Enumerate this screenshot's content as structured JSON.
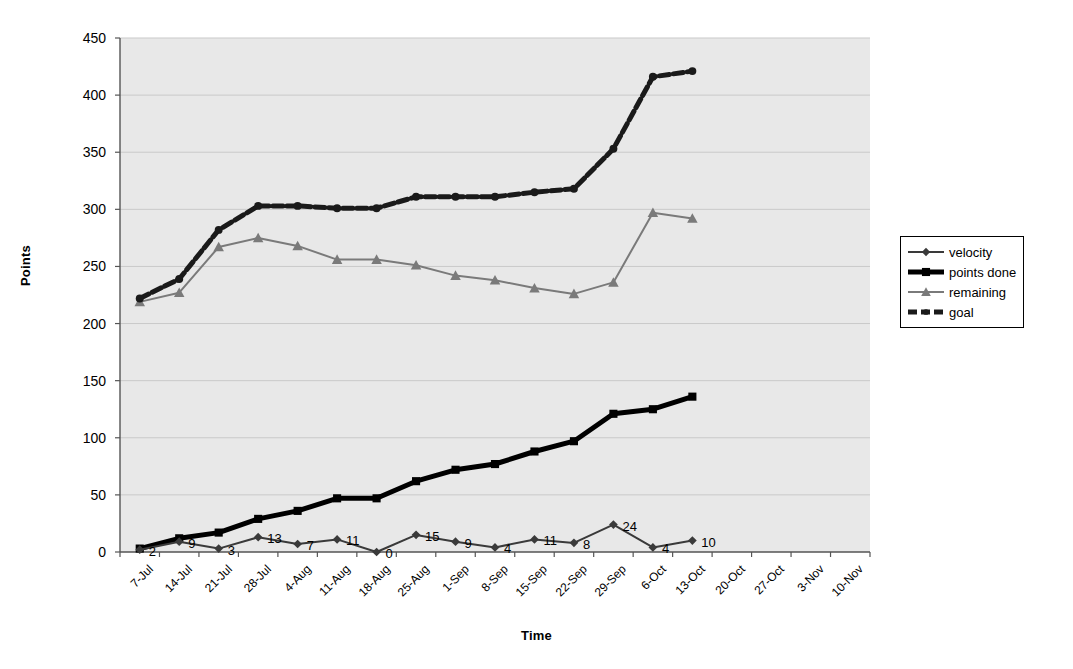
{
  "chart_data": {
    "type": "line",
    "title": "",
    "xlabel": "Time",
    "ylabel": "Points",
    "ylim": [
      0,
      450
    ],
    "ytick_step": 50,
    "yticks": [
      "0",
      "50",
      "100",
      "150",
      "200",
      "250",
      "300",
      "350",
      "400",
      "450"
    ],
    "grid": true,
    "legend_position": "right",
    "plot_background": "#e8e8e8",
    "categories": [
      "7-Jul",
      "14-Jul",
      "21-Jul",
      "28-Jul",
      "4-Aug",
      "11-Aug",
      "18-Aug",
      "25-Aug",
      "1-Sep",
      "8-Sep",
      "15-Sep",
      "22-Sep",
      "29-Sep",
      "6-Oct",
      "13-Oct",
      "20-Oct",
      "27-Oct",
      "3-Nov",
      "10-Nov"
    ],
    "series": [
      {
        "name": "velocity",
        "color": "#3a3a3a",
        "marker": "diamond",
        "line_width": 2,
        "values": [
          2,
          9,
          3,
          13,
          7,
          11,
          0,
          15,
          9,
          4,
          11,
          8,
          24,
          4,
          10,
          null,
          null,
          null,
          null
        ],
        "data_labels": [
          "2",
          "9",
          "3",
          "13",
          "7",
          "11",
          "0",
          "15",
          "9",
          "4",
          "11",
          "8",
          "24",
          "4",
          "10",
          "",
          "",
          "",
          ""
        ]
      },
      {
        "name": "points done",
        "color": "#000000",
        "marker": "square",
        "line_width": 5,
        "values": [
          3,
          12,
          17,
          29,
          36,
          47,
          47,
          62,
          72,
          77,
          88,
          97,
          121,
          125,
          136,
          null,
          null,
          null,
          null
        ],
        "data_labels": [
          "",
          "",
          "",
          "",
          "",
          "",
          "",
          "",
          "",
          "",
          "",
          "",
          "",
          "",
          "",
          "",
          "",
          "",
          ""
        ]
      },
      {
        "name": "remaining",
        "color": "#7a7a7a",
        "marker": "triangle",
        "line_width": 2,
        "values": [
          219,
          227,
          267,
          275,
          268,
          256,
          256,
          251,
          242,
          238,
          231,
          226,
          236,
          297,
          292,
          null,
          null,
          null,
          null
        ],
        "data_labels": [
          "",
          "",
          "",
          "",
          "",
          "",
          "",
          "",
          "",
          "",
          "",
          "",
          "",
          "",
          "",
          "",
          "",
          "",
          ""
        ]
      },
      {
        "name": "goal",
        "color": "#1a1a1a",
        "marker": "circle",
        "line_width": 5,
        "dashed": true,
        "values": [
          222,
          239,
          282,
          303,
          303,
          301,
          301,
          311,
          311,
          311,
          315,
          318,
          353,
          416,
          421,
          null,
          null,
          null,
          null
        ],
        "data_labels": [
          "",
          "",
          "",
          "",
          "",
          "",
          "",
          "",
          "",
          "",
          "",
          "",
          "",
          "",
          "",
          "",
          "",
          "",
          ""
        ]
      }
    ]
  },
  "legend": {
    "items": [
      {
        "label": "velocity"
      },
      {
        "label": "points done"
      },
      {
        "label": "remaining"
      },
      {
        "label": "goal"
      }
    ]
  }
}
